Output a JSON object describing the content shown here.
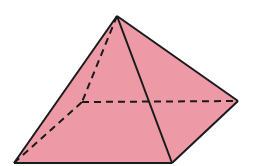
{
  "figure": {
    "title": "Square pyramid",
    "fill_color": "#EE9AA6",
    "edge_color": "#1a1a1a",
    "vertices": {
      "apex": [
        117,
        16
      ],
      "front_left": [
        14,
        163
      ],
      "front_right": [
        172,
        163
      ],
      "back_right": [
        238,
        101
      ],
      "back_left_hidden": [
        82,
        102
      ]
    },
    "visible_edges": [
      [
        "apex",
        "front_left"
      ],
      [
        "apex",
        "front_right"
      ],
      [
        "apex",
        "back_right"
      ],
      [
        "front_left",
        "front_right"
      ],
      [
        "front_right",
        "back_right"
      ]
    ],
    "hidden_edges": [
      [
        "apex",
        "back_left_hidden"
      ],
      [
        "front_left",
        "back_left_hidden"
      ],
      [
        "back_left_hidden",
        "back_right"
      ]
    ]
  }
}
